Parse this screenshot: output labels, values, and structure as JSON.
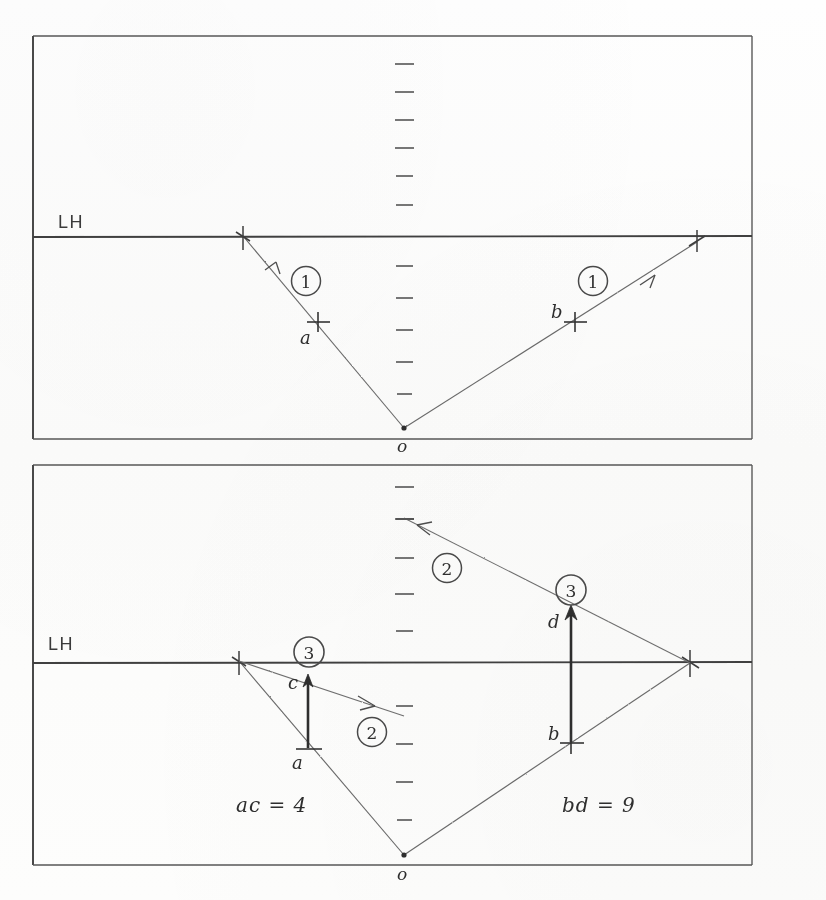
{
  "document": {
    "kind": "hand-drawn ray diagram",
    "panel_count": 2
  },
  "labels": {
    "lh": "LH",
    "origin": "o",
    "point_a": "a",
    "point_b": "b",
    "point_c": "c",
    "point_d": "d",
    "ray_one": "1",
    "ray_two": "2",
    "ray_three": "3",
    "eq_ac": "ac = 4",
    "eq_bd": "bd = 9"
  },
  "colors": {
    "ink": "#3a3a3a",
    "ink_light": "#5c5c5c",
    "frame": "#4a4a4a",
    "paper": "#fdfdfc",
    "arrow_heavy": "#2d2d2d"
  },
  "panels": [
    {
      "id": "top-panel",
      "name": "upper-diagram",
      "frame": {
        "x": 33,
        "y": 36,
        "width": 719,
        "height": 403
      },
      "lh_line_y": 237,
      "axis_x": 404,
      "origin": {
        "x": 404,
        "y": 428
      },
      "ticks_above": 7,
      "ticks_below": 6,
      "markers": [
        {
          "name": "a",
          "x": 318,
          "y": 322,
          "label_dx": -14,
          "label_dy": 18
        },
        {
          "name": "b",
          "x": 575,
          "y": 322,
          "label_dx": -17,
          "label_dy": -5
        }
      ],
      "rays": [
        {
          "name": "ray-left-1",
          "from": [
            404,
            428
          ],
          "to": [
            243,
            236
          ],
          "badge": "1",
          "badge_at": [
            306,
            281
          ]
        },
        {
          "name": "ray-right-1",
          "from": [
            404,
            428
          ],
          "to": [
            697,
            242
          ],
          "badge": "1",
          "badge_at": [
            567,
            281
          ]
        }
      ]
    },
    {
      "id": "bottom-panel",
      "name": "lower-diagram",
      "frame": {
        "x": 33,
        "y": 465,
        "width": 719,
        "height": 400
      },
      "lh_line_y": 663,
      "axis_x": 404,
      "origin": {
        "x": 404,
        "y": 855
      },
      "ticks_above": 7,
      "ticks_below": 6,
      "markers": [
        {
          "name": "a",
          "x": 308,
          "y": 748,
          "label_dx": -14,
          "label_dy": 18
        },
        {
          "name": "c",
          "x": 308,
          "y": 682,
          "label_dx": -16,
          "label_dy": 4
        },
        {
          "name": "b",
          "x": 571,
          "y": 742,
          "label_dx": -17,
          "label_dy": -4
        },
        {
          "name": "d",
          "x": 571,
          "y": 613,
          "label_dx": -17,
          "label_dy": 10
        }
      ],
      "verticals": [
        {
          "name": "vector-ac",
          "x": 308,
          "from_y": 748,
          "to_y": 676
        },
        {
          "name": "vector-bd",
          "x": 571,
          "from_y": 742,
          "to_y": 609
        }
      ],
      "rays": [
        {
          "name": "ray-left-2",
          "from": [
            239,
            661
          ],
          "to": [
            404,
            716
          ],
          "badge": "2",
          "badge_at": [
            368,
            706
          ]
        },
        {
          "name": "ray-right-2",
          "from": [
            404,
            518
          ],
          "to": [
            690,
            663
          ],
          "badge": "2",
          "badge_at": [
            436,
            563
          ]
        },
        {
          "name": "ray-left-o",
          "from": [
            404,
            855
          ],
          "to": [
            239,
            661
          ],
          "badge": null,
          "badge_at": null
        },
        {
          "name": "ray-right-o",
          "from": [
            404,
            855
          ],
          "to": [
            690,
            663
          ],
          "badge": null,
          "badge_at": null
        }
      ],
      "badges": [
        {
          "value": "3",
          "x": 309,
          "y": 652
        },
        {
          "value": "3",
          "x": 571,
          "y": 590
        }
      ],
      "equations": [
        {
          "text": "ac = 4",
          "x": 240,
          "y": 808
        },
        {
          "text": "bd = 9",
          "x": 565,
          "y": 808
        }
      ]
    }
  ]
}
